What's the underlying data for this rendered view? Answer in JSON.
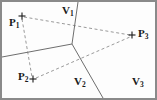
{
  "figure": {
    "type": "voronoi-delaunay-diagram",
    "frame": {
      "width": 157,
      "height": 100,
      "border_color": "#8a8a8a",
      "background_color": "#fdfdfd"
    },
    "sites": [
      {
        "id": "P1",
        "base": "P",
        "subscript": "1",
        "marker": "plus-marker",
        "x": 22,
        "y": 16,
        "label_x": 9,
        "label_y": 17
      },
      {
        "id": "P2",
        "base": "P",
        "subscript": "2",
        "marker": "plus-marker",
        "x": 33,
        "y": 79,
        "label_x": 18,
        "label_y": 71
      },
      {
        "id": "P3",
        "base": "P",
        "subscript": "3",
        "marker": "plus-marker",
        "x": 132,
        "y": 35,
        "label_x": 138,
        "label_y": 28
      }
    ],
    "regions": [
      {
        "id": "V1",
        "base": "V",
        "subscript": "1",
        "label_x": 62,
        "label_y": 5
      },
      {
        "id": "V2",
        "base": "V",
        "subscript": "2",
        "label_x": 74,
        "label_y": 76
      },
      {
        "id": "V3",
        "base": "V",
        "subscript": "3",
        "label_x": 132,
        "label_y": 76
      }
    ],
    "voronoi": {
      "stroke_color": "#6e6e6e",
      "stroke_width": 1,
      "vertex": {
        "x": 72,
        "y": 44
      },
      "edges": [
        {
          "name": "edge-V1-V3",
          "x1": 72,
          "y1": 44,
          "x2": 78,
          "y2": 2
        },
        {
          "name": "edge-V1-V2",
          "x1": 72,
          "y1": 44,
          "x2": 2,
          "y2": 57
        },
        {
          "name": "edge-V2-V3",
          "x1": 72,
          "y1": 44,
          "x2": 103,
          "y2": 98
        }
      ]
    },
    "delaunay": {
      "stroke_color": "#9a9a9a",
      "stroke_width": 1,
      "dash_pattern": "3,2.5",
      "edges": [
        {
          "name": "edge-P1-P3",
          "x1": 24,
          "y1": 17,
          "x2": 130,
          "y2": 35
        },
        {
          "name": "edge-P1-P2",
          "x1": 22,
          "y1": 19,
          "x2": 32,
          "y2": 77
        },
        {
          "name": "edge-P2-P3",
          "x1": 36,
          "y1": 78,
          "x2": 130,
          "y2": 37
        }
      ]
    },
    "marker": {
      "color": "#1a1a1a",
      "stroke_width": 1,
      "arm_length": 3.5
    }
  }
}
